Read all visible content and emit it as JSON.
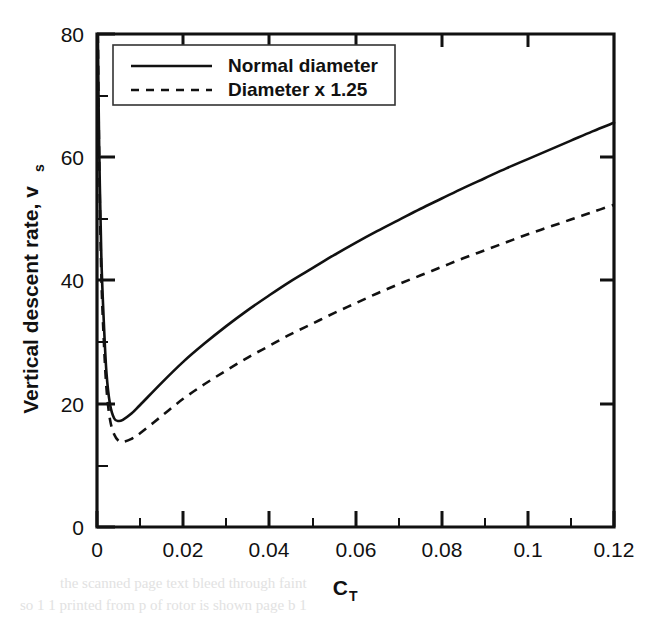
{
  "figure": {
    "background_color": "#ffffff",
    "ink_color": "#111111"
  },
  "legend": {
    "position": "top-left-inside",
    "entries": [
      {
        "label": "Normal diameter",
        "style": "solid"
      },
      {
        "label": "Diameter x 1.25",
        "style": "dashed"
      }
    ]
  },
  "axes": {
    "x": {
      "title_main": "C",
      "title_sub": "T",
      "tick_labels": [
        "0",
        "0.02",
        "0.04",
        "0.06",
        "0.08",
        "0.1",
        "0.12"
      ],
      "tick_values": [
        0,
        0.02,
        0.04,
        0.06,
        0.08,
        0.1,
        0.12
      ],
      "minor_tick_values": [
        0.01,
        0.03,
        0.05,
        0.07,
        0.09,
        0.11
      ],
      "min": 0,
      "max": 0.12
    },
    "y": {
      "title_main": "Vertical descent rate, v",
      "title_sub": "s",
      "tick_labels": [
        "0",
        "20",
        "40",
        "60",
        "80"
      ],
      "tick_values": [
        0,
        20,
        40,
        60,
        80
      ],
      "minor_tick_values": [
        10,
        30,
        50,
        70
      ],
      "min": 0,
      "max": 80
    }
  },
  "chart_data": {
    "type": "line",
    "title": "",
    "xlabel": "C_T",
    "ylabel": "Vertical descent rate, v_s",
    "xlim": [
      0,
      0.12
    ],
    "ylim": [
      0,
      80
    ],
    "grid": false,
    "legend_position": "upper left (inside plot)",
    "series": [
      {
        "name": "Normal diameter",
        "style": "solid",
        "x": [
          0.0002,
          0.0005,
          0.001,
          0.0016,
          0.0022,
          0.003,
          0.004,
          0.005,
          0.006,
          0.008,
          0.01,
          0.015,
          0.02,
          0.025,
          0.03,
          0.035,
          0.04,
          0.045,
          0.05,
          0.055,
          0.06,
          0.065,
          0.07,
          0.075,
          0.08,
          0.085,
          0.09,
          0.095,
          0.1,
          0.105,
          0.11,
          0.115,
          0.12
        ],
        "y": [
          80.0,
          62.0,
          44.0,
          33.0,
          25.0,
          20.0,
          17.6,
          17.2,
          17.4,
          18.4,
          19.8,
          23.4,
          26.8,
          29.8,
          32.6,
          35.2,
          37.6,
          39.9,
          42.0,
          44.1,
          46.1,
          48.0,
          49.8,
          51.6,
          53.3,
          55.0,
          56.6,
          58.2,
          59.7,
          61.2,
          62.7,
          64.2,
          65.6
        ]
      },
      {
        "name": "Diameter x 1.25",
        "style": "dashed",
        "x": [
          0.0002,
          0.0005,
          0.001,
          0.0016,
          0.0022,
          0.003,
          0.004,
          0.005,
          0.006,
          0.008,
          0.01,
          0.015,
          0.02,
          0.025,
          0.03,
          0.035,
          0.04,
          0.045,
          0.05,
          0.055,
          0.06,
          0.065,
          0.07,
          0.075,
          0.08,
          0.085,
          0.09,
          0.095,
          0.1,
          0.105,
          0.11,
          0.115,
          0.12
        ],
        "y": [
          80.0,
          60.0,
          41.0,
          30.0,
          22.5,
          17.5,
          15.0,
          14.0,
          13.8,
          14.3,
          15.2,
          18.0,
          20.8,
          23.2,
          25.4,
          27.5,
          29.4,
          31.3,
          33.0,
          34.7,
          36.3,
          37.9,
          39.4,
          40.8,
          42.2,
          43.6,
          44.9,
          46.2,
          47.5,
          48.7,
          49.9,
          51.1,
          52.3
        ]
      }
    ]
  },
  "artifacts": {
    "bleed_line_1": "the  scanned  page  text  bleed  through  faint",
    "bleed_line_2": "so  1  1  printed  from  p  of  rotor  is  shown  page  b  1"
  }
}
